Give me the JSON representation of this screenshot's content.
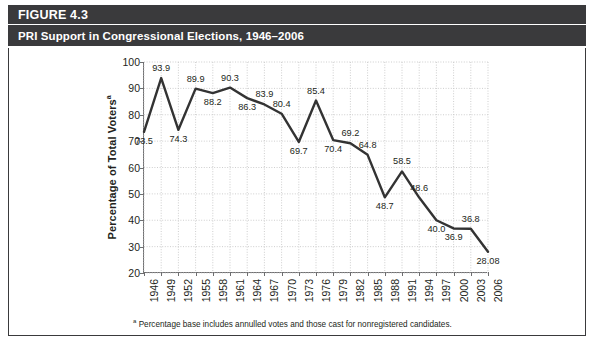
{
  "header": {
    "figure_label": "FIGURE 4.3",
    "title": "PRI Support in Congressional Elections, 1946–2006"
  },
  "footnote": {
    "marker": "a",
    "text": "Percentage base includes annulled votes and those cast for nonregistered candidates."
  },
  "axis": {
    "y_title": "Percentage of Total Voters",
    "y_title_sup": "a"
  },
  "colors": {
    "header_bar": "#3a3a3c",
    "header_text": "#ffffff",
    "line": "#333333",
    "grid": "#c8c8c8",
    "axis": "#6e6e70",
    "text": "#231f20"
  },
  "chart_data": {
    "type": "line",
    "title": "PRI Support in Congressional Elections, 1946–2006",
    "xlabel": "",
    "ylabel": "Percentage of Total Voters",
    "ylim": [
      20,
      100
    ],
    "yticks": [
      20,
      30,
      40,
      50,
      60,
      70,
      80,
      90,
      100
    ],
    "grid": true,
    "legend": "none",
    "categories": [
      "1946",
      "1949",
      "1952",
      "1955",
      "1958",
      "1961",
      "1964",
      "1967",
      "1970",
      "1973",
      "1976",
      "1979",
      "1982",
      "1985",
      "1988",
      "1991",
      "1994",
      "1997",
      "2000",
      "2003",
      "2006"
    ],
    "values": [
      73.5,
      93.9,
      74.3,
      89.9,
      88.2,
      90.3,
      86.3,
      83.9,
      80.4,
      69.7,
      85.4,
      70.4,
      69.2,
      64.8,
      48.7,
      58.5,
      48.6,
      40.0,
      36.9,
      36.8,
      28.08
    ],
    "point_labels": [
      "73.5",
      "93.9",
      "74.3",
      "89.9",
      "88.2",
      "90.3",
      "86.3",
      "83.9",
      "80.4",
      "69.7",
      "85.4",
      "70.4",
      "69.2",
      "64.8",
      "48.7",
      "58.5",
      "48.6",
      "40.0",
      "36.9",
      "36.8",
      "28.08"
    ],
    "label_placement": [
      "below",
      "above",
      "below",
      "above",
      "below",
      "above",
      "below",
      "above",
      "above",
      "below",
      "above",
      "below",
      "above",
      "above",
      "below",
      "above",
      "above",
      "below",
      "below",
      "above",
      "below"
    ]
  }
}
